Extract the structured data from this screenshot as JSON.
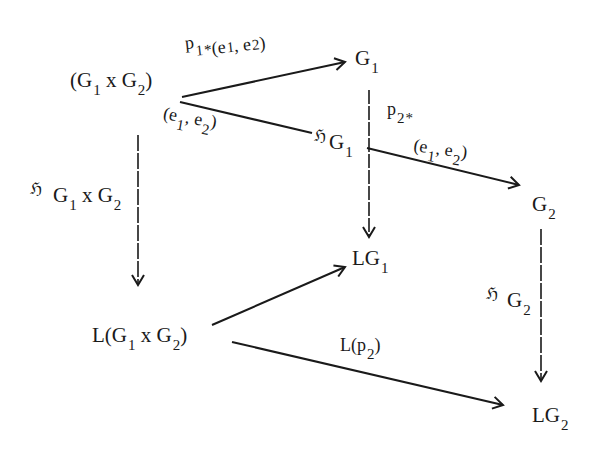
{
  "diagram": {
    "colors": {
      "ink": "#1a1a1a",
      "background": "#ffffff"
    },
    "nodes": {
      "product_pointed": {
        "base": "(G",
        "i1": "1",
        "x": " x G",
        "i2": "2",
        "close": ")",
        "point_open": "(e",
        "p1": "1",
        "comma": ", e",
        "p2": "2",
        "point_close": ")"
      },
      "g1": {
        "base": "G",
        "sub": "1"
      },
      "h_g1": {
        "frak": "ℌ",
        "base": "G",
        "sub": "1"
      },
      "g2": {
        "base": "G",
        "sub": "2"
      },
      "lg1": {
        "base": "LG",
        "sub": "1"
      },
      "l_product": {
        "open": "L(G",
        "i1": "1",
        "x": " x G",
        "i2": "2",
        "close": ")"
      },
      "lg2": {
        "base": "LG",
        "sub": "2"
      }
    },
    "edges": {
      "p1_star": {
        "base": "p",
        "sub": "1",
        "star": "*",
        "arg_open": "(e",
        "a1": "1",
        "comma": ", e",
        "a2": "2",
        "arg_close": ")"
      },
      "p2_star": {
        "base": "p",
        "sub": "2",
        "star": "*",
        "arg_open": "(e",
        "a1": "1",
        "comma": ", e",
        "a2": "2",
        "arg_close": ")"
      },
      "h_product": {
        "frak": "ℌ",
        "base": "G",
        "i1": "1",
        "x": " x G",
        "i2": "2"
      },
      "h_g2": {
        "frak": "ℌ",
        "base": "G",
        "sub": "2"
      },
      "l_p2": {
        "open": "L(p",
        "sub": "2",
        "close": ")"
      }
    }
  }
}
